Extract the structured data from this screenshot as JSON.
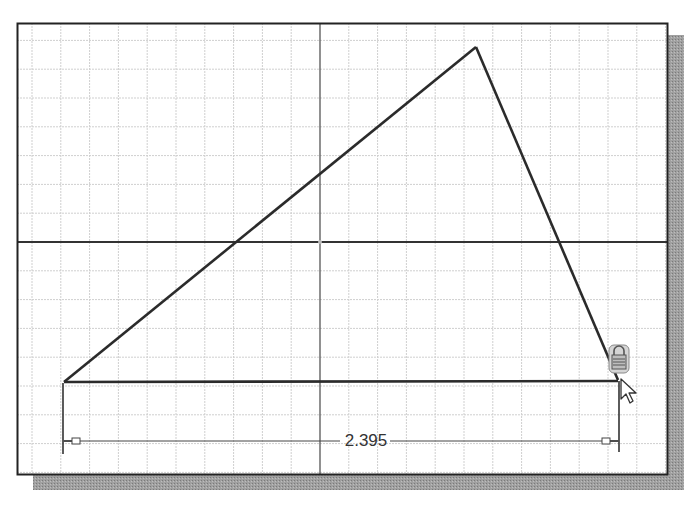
{
  "sketch": {
    "frame": {
      "x": 17,
      "y": 23,
      "width": 651,
      "height": 452
    },
    "shadow_color": "#9a9a9a",
    "grid": {
      "spacing": 28.8,
      "color": "#cfcfcf",
      "axis_color": "#333333",
      "origin": {
        "x": 320,
        "y": 242
      }
    },
    "triangle": {
      "vertices": [
        {
          "name": "left-vertex",
          "x": 64,
          "y": 382
        },
        {
          "name": "apex-vertex",
          "x": 476,
          "y": 47
        },
        {
          "name": "right-vertex",
          "x": 618,
          "y": 380
        }
      ],
      "stroke_color": "#2b2b2b"
    },
    "dimension": {
      "value": "2.395",
      "line_y": 441,
      "x1": 63,
      "x2": 619,
      "text_x": 366,
      "text_y": 446
    },
    "icons": {
      "constraint": "lock-icon",
      "cursor": "arrow-cursor-icon"
    }
  }
}
